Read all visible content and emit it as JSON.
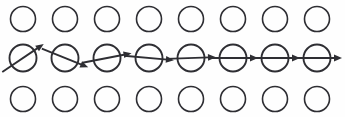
{
  "figure": {
    "width": 345,
    "height": 117,
    "background_color": "#fefefe",
    "stroke_color": "#2e2e33",
    "columns": 8,
    "rows": 3
  },
  "geometry": {
    "column_x": [
      23,
      65,
      107,
      149,
      191,
      233,
      275,
      317
    ],
    "row_top_cy": 19,
    "row_middle_cy": 58,
    "row_bottom_cy": 99,
    "plain_radius": 12.5,
    "middle_radius": 13.5,
    "plain_stroke_width": 1.6,
    "arrow_circle_stroke_width": 1.9,
    "arrow_stroke_width": 1.9,
    "arrow_half_length": 25,
    "arrow_head_length": 8,
    "arrow_head_half_width": 3.4
  },
  "rows": [
    {
      "name": "top-row",
      "kind": "plain",
      "label": "Top row of empty circles",
      "cells": [
        {
          "index": 1,
          "kind": "circle"
        },
        {
          "index": 2,
          "kind": "circle"
        },
        {
          "index": 3,
          "kind": "circle"
        },
        {
          "index": 4,
          "kind": "circle"
        },
        {
          "index": 5,
          "kind": "circle"
        },
        {
          "index": 6,
          "kind": "circle"
        },
        {
          "index": 7,
          "kind": "circle"
        },
        {
          "index": 8,
          "kind": "circle"
        }
      ]
    },
    {
      "name": "middle-row",
      "kind": "arrow",
      "label": "Middle row of circles with arrows",
      "cells": [
        {
          "index": 1,
          "kind": "circle-with-arrow",
          "angle_deg": -34,
          "arrow_direction": "up-right"
        },
        {
          "index": 2,
          "kind": "circle-with-arrow",
          "angle_deg": 22,
          "arrow_direction": "down-right"
        },
        {
          "index": 3,
          "kind": "circle-with-arrow",
          "angle_deg": -11,
          "arrow_direction": "slightly-up-right"
        },
        {
          "index": 4,
          "kind": "circle-with-arrow",
          "angle_deg": 5,
          "arrow_direction": "slightly-down-right"
        },
        {
          "index": 5,
          "kind": "circle-with-arrow",
          "angle_deg": -2,
          "arrow_direction": "right"
        },
        {
          "index": 6,
          "kind": "circle-with-arrow",
          "angle_deg": 0,
          "arrow_direction": "right"
        },
        {
          "index": 7,
          "kind": "circle-with-arrow",
          "angle_deg": 0,
          "arrow_direction": "right"
        },
        {
          "index": 8,
          "kind": "circle-with-arrow",
          "angle_deg": 0,
          "arrow_direction": "right"
        }
      ]
    },
    {
      "name": "bottom-row",
      "kind": "plain",
      "label": "Bottom row of empty circles",
      "cells": [
        {
          "index": 1,
          "kind": "circle"
        },
        {
          "index": 2,
          "kind": "circle"
        },
        {
          "index": 3,
          "kind": "circle"
        },
        {
          "index": 4,
          "kind": "circle"
        },
        {
          "index": 5,
          "kind": "circle"
        },
        {
          "index": 6,
          "kind": "circle"
        },
        {
          "index": 7,
          "kind": "circle"
        },
        {
          "index": 8,
          "kind": "circle"
        }
      ]
    }
  ]
}
